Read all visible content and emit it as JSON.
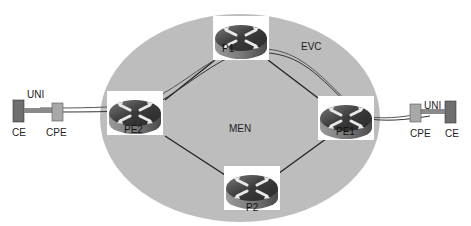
{
  "diagram": {
    "network": {
      "label": "MEN",
      "fill": "#bdbdbd"
    },
    "evc_label": "EVC",
    "routers": [
      {
        "id": "p1",
        "label": "P1"
      },
      {
        "id": "p2",
        "label": "P2"
      },
      {
        "id": "pe1",
        "label": "PE1"
      },
      {
        "id": "pe2",
        "label": "PE2"
      }
    ],
    "left_site": {
      "ce": "CE",
      "cpe": "CPE",
      "uni": "UNI"
    },
    "right_site": {
      "ce": "CE",
      "cpe": "CPE",
      "uni": "UNI"
    },
    "colors": {
      "cloud": "#bdbdbd",
      "router_top": "#4a4a4a",
      "router_side": "#8a8a8a",
      "ce": "#6e6e6e",
      "cpe": "#a8a8a8",
      "link": "#222222"
    }
  }
}
